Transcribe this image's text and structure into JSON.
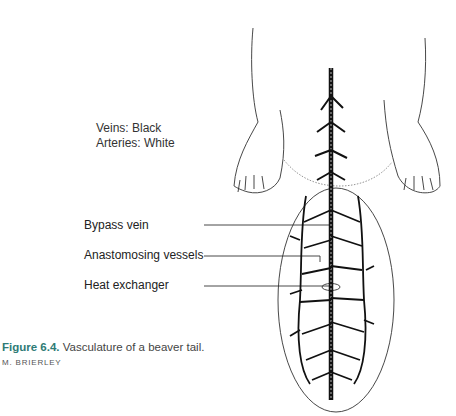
{
  "legend": {
    "veins": "Veins: Black",
    "arteries": "Arteries: White"
  },
  "labels": [
    {
      "text": "Bypass vein",
      "y": 224
    },
    {
      "text": "Anastomosing vessels",
      "y": 254
    },
    {
      "text": "Heat exchanger",
      "y": 284
    }
  ],
  "caption": {
    "figure_number": "Figure 6.4.",
    "text": " Vasculature of a beaver tail.",
    "credit": "M. BRIERLEY"
  },
  "colors": {
    "caption_accent": "#2e7b76",
    "line": "#222222"
  }
}
